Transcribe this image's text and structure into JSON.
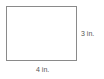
{
  "diagram": {
    "shape": "rectangle",
    "stroke_color": "#8a8a8a",
    "fill_color": "#ffffff",
    "labels": {
      "height": "3 in.",
      "width": "4 in."
    },
    "dimensions": {
      "width_value": 4,
      "height_value": 3,
      "unit": "in."
    }
  }
}
